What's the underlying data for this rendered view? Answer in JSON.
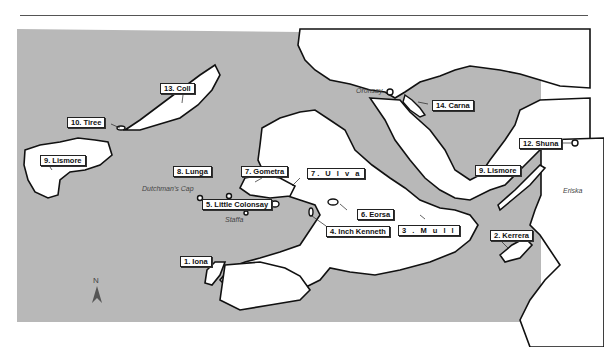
{
  "map": {
    "sea_color": "#b8b8b8",
    "land_color": "#ffffff",
    "coast_color": "#111111",
    "islands": [
      {
        "id": 1,
        "label": "1. Iona"
      },
      {
        "id": 2,
        "label": "2. Kerrera"
      },
      {
        "id": 3,
        "label": "3 . M u l l"
      },
      {
        "id": 4,
        "label": "4. Inch Kenneth"
      },
      {
        "id": 5,
        "label": "5. Little Colonsay"
      },
      {
        "id": 6,
        "label": "6. Eorsa"
      },
      {
        "id": 7,
        "label": "7. Gometra"
      },
      {
        "id": 7,
        "label": "7. U l v a"
      },
      {
        "id": 8,
        "label": "8. Lunga"
      },
      {
        "id": 9,
        "label": "9. Lismore"
      },
      {
        "id": 10,
        "label": "10. Tiree"
      },
      {
        "id": 11,
        "label": "11. Gunna"
      },
      {
        "id": 12,
        "label": "12. Shuna"
      },
      {
        "id": 13,
        "label": "13. Coll"
      },
      {
        "id": 14,
        "label": "14. Carna"
      }
    ],
    "other_places": [
      "Oronsay",
      "Dutchman's Cap",
      "Staffa",
      "Eriska"
    ],
    "north_arrow": "N"
  }
}
